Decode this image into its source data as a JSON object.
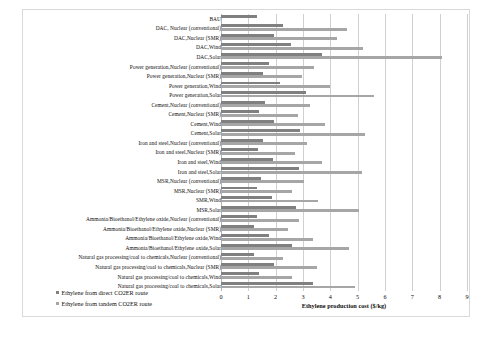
{
  "chart_data": {
    "type": "bar",
    "orientation": "horizontal",
    "title": "",
    "xlabel": "Ethylene production cost ($/kg)",
    "ylabel": "",
    "xlim": [
      0,
      9
    ],
    "xticks": [
      0,
      1,
      2,
      3,
      4,
      5,
      6,
      7,
      8,
      9
    ],
    "grid": true,
    "legend_position": "bottom-left",
    "colors": {
      "direct": "#808080",
      "tandem": "#a6a6a6",
      "grid": "#d0d0d0",
      "frame": "#d9d9d9",
      "background": "#ffffff"
    },
    "categories": [
      "BAU",
      "DAC, Nuclear (conventional)",
      "DAC,Nuclear (SMR)",
      "DAC,Wind",
      "DAC,Solar",
      "Power generation,Nuclear (conventional)",
      "Power generation,Nuclear (SMR)",
      "Power generation,Wind",
      "Power generation,Solar",
      "Cement,Nuclear (conventional)",
      "Cement,Nuclear (SMR)",
      "Cement,Wind",
      "Cement,Solar",
      "Iron and steel,Nuclear (conventional)",
      "Iron and steel,Nuclear (SMR)",
      "Iron and steel,Wind",
      "Iron and steel,Solar",
      "MSR,Nuclear (conventional)",
      "MSR,Nuclear (SMR)",
      "SMR,Wind",
      "MSR,Solar",
      "Ammonia/Bioethanol/Ethylene oxide,Nuclear (conventional)",
      "Ammonia/Bioethanol/Ethylene oxide,Nuclear (SMR)",
      "Ammonia/Bioethanol/Ethylene oxide,Wind",
      "Ammonia/Bioethanol/Ethylene oxide,Solar",
      "Natural gas processing/coal to chemicals,Nuclear (conventional)",
      "Natural gas processing/coal to chemicals,Nuclear (SMR)",
      "Natural gas processing/coal to chemicals,Wind",
      "Natural gas processing/coal to chemicals,Solar"
    ],
    "series": [
      {
        "name": "Ethylene from direct CO2ER route",
        "key": "direct",
        "values": [
          1.33,
          2.25,
          1.95,
          2.55,
          3.7,
          1.75,
          1.55,
          2.15,
          3.1,
          1.6,
          1.4,
          1.95,
          2.9,
          1.55,
          1.35,
          1.9,
          2.85,
          1.45,
          1.3,
          1.85,
          2.75,
          1.3,
          1.2,
          1.75,
          2.6,
          1.2,
          1.95,
          1.4,
          3.35
        ]
      },
      {
        "name": "Ethylene from tandem CO2ER route",
        "key": "tandem",
        "values": [
          null,
          4.6,
          4.25,
          5.2,
          8.1,
          3.4,
          2.95,
          4.0,
          5.6,
          3.25,
          2.8,
          3.8,
          5.25,
          3.15,
          2.7,
          3.7,
          5.15,
          3.05,
          2.6,
          3.55,
          5.05,
          2.85,
          2.45,
          3.35,
          4.7,
          2.25,
          3.5,
          2.6,
          4.9
        ]
      }
    ]
  },
  "legend": {
    "items": [
      {
        "label": "Ethylene from direct CO2ER route",
        "key": "direct"
      },
      {
        "label": "Ethylene from tandem CO2ER route",
        "key": "tandem"
      }
    ]
  },
  "caption": {
    "text": ""
  }
}
